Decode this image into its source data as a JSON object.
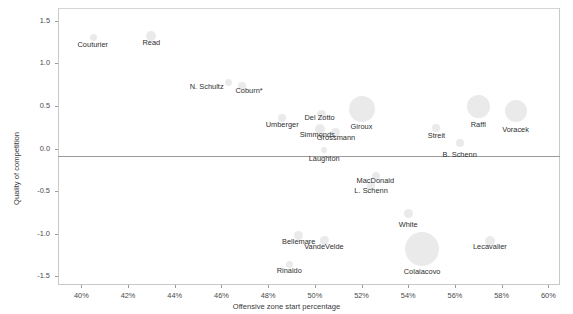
{
  "chart_data": {
    "type": "scatter",
    "title": "",
    "xlabel": "Offensive zone start percentage",
    "ylabel": "Quality of competition",
    "xlim": [
      0.39,
      0.605
    ],
    "ylim": [
      -1.6,
      1.65
    ],
    "xticks": [
      "40%",
      "42%",
      "44%",
      "46%",
      "48%",
      "50%",
      "52%",
      "54%",
      "56%",
      "58%",
      "60%"
    ],
    "xtick_values": [
      40,
      42,
      44,
      46,
      48,
      50,
      52,
      54,
      56,
      58,
      60
    ],
    "yticks": [
      "1.5",
      "1.0",
      "0.5",
      "0.0",
      "-0.5",
      "-1.0",
      "-1.5"
    ],
    "ytick_values": [
      1.5,
      1.0,
      0.5,
      0.0,
      -0.5,
      -1.0,
      -1.5
    ],
    "grid": false,
    "zero_line": true,
    "bubble_color": "#d9d9d9",
    "points": [
      {
        "label": "Couturier",
        "x": 40.5,
        "y": 1.3,
        "size": 7,
        "lx": 40.5,
        "ly": 1.22,
        "anchor": "center"
      },
      {
        "label": "Read",
        "x": 43.0,
        "y": 1.32,
        "size": 10,
        "lx": 43.0,
        "ly": 1.24,
        "anchor": "center"
      },
      {
        "label": "N. Schultz",
        "x": 46.3,
        "y": 0.78,
        "size": 7,
        "lx": 46.1,
        "ly": 0.72,
        "anchor": "end"
      },
      {
        "label": "Coburn*",
        "x": 46.9,
        "y": 0.74,
        "size": 8,
        "lx": 46.6,
        "ly": 0.68,
        "anchor": "start"
      },
      {
        "label": "Umberger",
        "x": 48.6,
        "y": 0.36,
        "size": 8,
        "lx": 48.6,
        "ly": 0.28,
        "anchor": "center"
      },
      {
        "label": "Del Zotto",
        "x": 50.3,
        "y": 0.4,
        "size": 9,
        "lx": 50.2,
        "ly": 0.36,
        "anchor": "center"
      },
      {
        "label": "Simmonds",
        "x": 50.2,
        "y": 0.23,
        "size": 10,
        "lx": 50.1,
        "ly": 0.16,
        "anchor": "center"
      },
      {
        "label": "Grossmann",
        "x": 50.9,
        "y": 0.19,
        "size": 9,
        "lx": 50.9,
        "ly": 0.12,
        "anchor": "center"
      },
      {
        "label": "Giroux",
        "x": 52.0,
        "y": 0.46,
        "size": 26,
        "lx": 52.0,
        "ly": 0.25,
        "anchor": "center"
      },
      {
        "label": "Laughton",
        "x": 50.4,
        "y": -0.02,
        "size": 6,
        "lx": 50.4,
        "ly": -0.12,
        "anchor": "center"
      },
      {
        "label": "MacDonald",
        "x": 52.6,
        "y": -0.32,
        "size": 8,
        "lx": 52.6,
        "ly": -0.38,
        "anchor": "center"
      },
      {
        "label": "L. Schenn",
        "x": 52.4,
        "y": -0.44,
        "size": 8,
        "lx": 52.4,
        "ly": -0.5,
        "anchor": "center"
      },
      {
        "label": "Streit",
        "x": 55.2,
        "y": 0.24,
        "size": 8,
        "lx": 55.2,
        "ly": 0.15,
        "anchor": "center"
      },
      {
        "label": "B. Schenn",
        "x": 56.2,
        "y": 0.07,
        "size": 8,
        "lx": 56.2,
        "ly": -0.07,
        "anchor": "center"
      },
      {
        "label": "Raffl",
        "x": 57.0,
        "y": 0.5,
        "size": 23,
        "lx": 57.0,
        "ly": 0.28,
        "anchor": "center"
      },
      {
        "label": "Voracek",
        "x": 58.6,
        "y": 0.44,
        "size": 22,
        "lx": 58.6,
        "ly": 0.22,
        "anchor": "center"
      },
      {
        "label": "White",
        "x": 54.0,
        "y": -0.76,
        "size": 9,
        "lx": 54.0,
        "ly": -0.9,
        "anchor": "center"
      },
      {
        "label": "Colaiacovo",
        "x": 54.6,
        "y": -1.18,
        "size": 34,
        "lx": 54.6,
        "ly": -1.45,
        "anchor": "center"
      },
      {
        "label": "Bellemare",
        "x": 49.3,
        "y": -1.02,
        "size": 9,
        "lx": 49.3,
        "ly": -1.1,
        "anchor": "center"
      },
      {
        "label": "VandeVelde",
        "x": 50.4,
        "y": -1.08,
        "size": 9,
        "lx": 50.4,
        "ly": -1.16,
        "anchor": "center"
      },
      {
        "label": "Rinaldo",
        "x": 48.9,
        "y": -1.36,
        "size": 7,
        "lx": 48.9,
        "ly": -1.44,
        "anchor": "center"
      },
      {
        "label": "Lecavalier",
        "x": 57.5,
        "y": -1.08,
        "size": 10,
        "lx": 57.5,
        "ly": -1.16,
        "anchor": "center"
      }
    ]
  }
}
